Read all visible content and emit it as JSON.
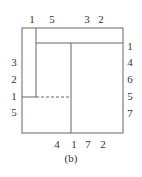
{
  "caption": "(b)",
  "top_labels": [
    {
      "text": "1",
      "x": 32
    },
    {
      "text": "5",
      "x": 52
    },
    {
      "text": "3",
      "x": 87
    },
    {
      "text": "2",
      "x": 101
    }
  ],
  "left_labels": [
    {
      "text": "3",
      "y": 65
    },
    {
      "text": "2",
      "y": 82
    },
    {
      "text": "1",
      "y": 99
    },
    {
      "text": "5",
      "y": 115
    }
  ],
  "right_labels": [
    {
      "text": "1",
      "y": 48
    },
    {
      "text": "4",
      "y": 65
    },
    {
      "text": "6",
      "y": 82
    },
    {
      "text": "5",
      "y": 99
    },
    {
      "text": "7",
      "y": 116
    }
  ],
  "bottom_labels": [
    {
      "text": "4",
      "x": 57
    },
    {
      "text": "1",
      "x": 74
    },
    {
      "text": "7",
      "x": 88
    },
    {
      "text": "2",
      "x": 103
    }
  ],
  "colors": {
    "line": "#555555",
    "text": "#333333"
  }
}
